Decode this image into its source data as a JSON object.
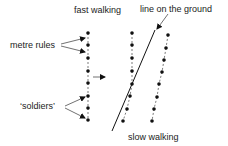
{
  "labels": {
    "fast_walking": "fast walking",
    "line_on_ground": "line on the ground",
    "metre_rules": "metre rules",
    "soldiers": "‘soldiers’",
    "slow_walking": "slow walking"
  },
  "colors": {
    "ink": "#111111",
    "text": "#222222",
    "background": "#ffffff"
  },
  "columns": [
    {
      "name": "left-column",
      "dots": [
        [
          88,
          33
        ],
        [
          88,
          45
        ],
        [
          88,
          58
        ],
        [
          88,
          71
        ],
        [
          88,
          83
        ],
        [
          88,
          96
        ],
        [
          88,
          108
        ],
        [
          88,
          120
        ]
      ]
    },
    {
      "name": "middle-column",
      "dots": [
        [
          132,
          33
        ],
        [
          132,
          45
        ],
        [
          132,
          58
        ],
        [
          132,
          71
        ],
        [
          132,
          84
        ],
        [
          130,
          96
        ],
        [
          127,
          109
        ],
        [
          123,
          121
        ]
      ]
    },
    {
      "name": "right-column",
      "dots": [
        [
          168,
          35
        ],
        [
          166,
          48
        ],
        [
          164,
          60
        ],
        [
          162,
          72
        ],
        [
          159,
          84
        ],
        [
          157,
          97
        ],
        [
          154,
          109
        ],
        [
          152,
          121
        ]
      ]
    }
  ],
  "ground_line": {
    "x1": 112,
    "y1": 131,
    "x2": 155,
    "y2": 30
  }
}
